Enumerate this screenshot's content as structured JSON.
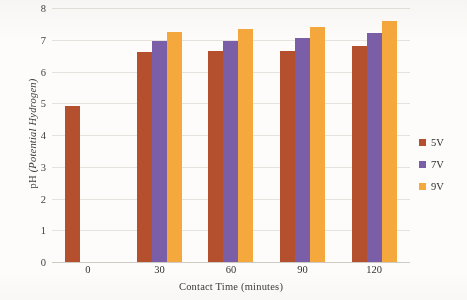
{
  "chart_data": {
    "type": "bar",
    "title": "",
    "xlabel": "Contact Time (minutes)",
    "ylabel": "pH (Potential Hydrogen)",
    "ylabel_prefix": "pH ",
    "ylabel_italic": "(Potential Hydrogen)",
    "categories": [
      "0",
      "30",
      "60",
      "90",
      "120"
    ],
    "series": [
      {
        "name": "5V",
        "color": "#b5502f",
        "values": [
          4.9,
          6.6,
          6.65,
          6.65,
          6.8
        ]
      },
      {
        "name": "7V",
        "color": "#7a5fa8",
        "values": [
          null,
          6.95,
          6.95,
          7.05,
          7.2
        ]
      },
      {
        "name": "9V",
        "color": "#f5a83c",
        "values": [
          null,
          7.25,
          7.35,
          7.4,
          7.6
        ]
      }
    ],
    "ylim": [
      0,
      8
    ],
    "yticks": [
      "0",
      "1",
      "2",
      "3",
      "4",
      "5",
      "6",
      "7",
      "8"
    ],
    "grid": true,
    "legend_position": "right"
  },
  "legend": {
    "items": [
      {
        "label": "5V",
        "color": "#b5502f"
      },
      {
        "label": "7V",
        "color": "#7a5fa8"
      },
      {
        "label": "9V",
        "color": "#f5a83c"
      }
    ]
  }
}
